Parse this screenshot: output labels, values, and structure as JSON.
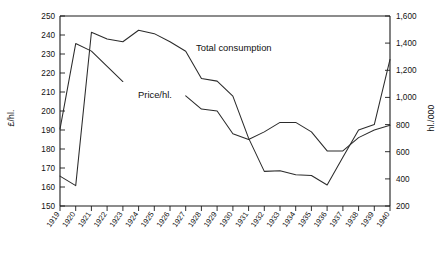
{
  "chart_data": {
    "type": "line",
    "title": "",
    "subtitle": "",
    "xlabel": "",
    "grid": false,
    "legend_position": "inline-annotation",
    "x": [
      "1919",
      "1920",
      "1921",
      "1922",
      "1923",
      "1924",
      "1925",
      "1926",
      "1927",
      "1928",
      "1929",
      "1930",
      "1931",
      "1932",
      "1933",
      "1934",
      "1935",
      "1936",
      "1937",
      "1938",
      "1939",
      "1940"
    ],
    "axes": {
      "left": {
        "label": "£/hl.",
        "min": 150,
        "max": 250,
        "step": 10,
        "ticks": [
          "150",
          "160",
          "170",
          "180",
          "190",
          "200",
          "210",
          "220",
          "230",
          "240",
          "250"
        ]
      },
      "right": {
        "label": "hl./000",
        "min": 200,
        "max": 1600,
        "step": 200,
        "ticks": [
          "200",
          "400",
          "600",
          "800",
          "1,000",
          "1,200",
          "1,400",
          "1,600"
        ]
      }
    },
    "series": [
      {
        "name": "Price/hl.",
        "axis": "left",
        "units": "£/hl.",
        "label_text": "Price/hl.",
        "x": [
          "1919",
          "1920",
          "1921",
          "1922",
          "1923"
        ],
        "values": [
          190.5,
          235.5,
          231.5,
          223.5,
          215.5
        ]
      },
      {
        "name": "Total consumption",
        "axis": "right",
        "units": "hl./000",
        "label_text": "Total consumption",
        "x": [
          "1919",
          "1920",
          "1921",
          "1922",
          "1923",
          "1924",
          "1925",
          "1926",
          "1927",
          "1928",
          "1929",
          "1930",
          "1931",
          "1932",
          "1933",
          "1934",
          "1935",
          "1936",
          "1937",
          "1938",
          "1939",
          "1940"
        ],
        "values": [
          420,
          350,
          1480,
          1430,
          1410,
          1495,
          1470,
          1410,
          1340,
          1140,
          1120,
          1010,
          700,
          455,
          460,
          430,
          425,
          355,
          560,
          760,
          800,
          1280
        ]
      },
      {
        "name": "Price/hl. continued",
        "axis": "left",
        "units": "£/hl.",
        "label_text": "",
        "x": [
          "1927",
          "1928",
          "1929",
          "1930",
          "1931",
          "1932",
          "1933",
          "1934",
          "1935",
          "1936",
          "1937",
          "1938",
          "1939",
          "1940"
        ],
        "values": [
          208,
          201,
          200,
          188,
          185,
          189,
          194,
          194,
          189,
          179,
          179,
          186,
          190,
          192.5
        ]
      }
    ],
    "annotations": [
      {
        "text": "Total consumption",
        "x_year": "1927",
        "value_left_axis": 228
      },
      {
        "text": "Price/hl.",
        "x_year": "1923",
        "value_left_axis": 209
      }
    ]
  },
  "caption": {
    "text": ""
  }
}
